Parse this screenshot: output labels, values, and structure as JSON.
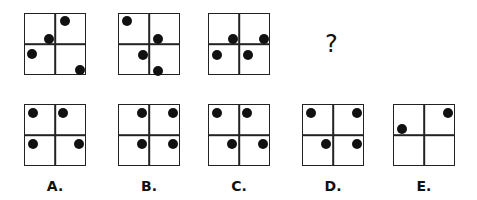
{
  "question": {
    "sequence": [
      {
        "id": "seq-1",
        "x": 24,
        "y": 13,
        "dots": [
          [
            40,
            7
          ],
          [
            24,
            25
          ],
          [
            7,
            40
          ],
          [
            55,
            56
          ]
        ]
      },
      {
        "id": "seq-2",
        "x": 118,
        "y": 13,
        "dots": [
          [
            8,
            7
          ],
          [
            39,
            25
          ],
          [
            24,
            41
          ],
          [
            39,
            57
          ]
        ]
      },
      {
        "id": "seq-3",
        "x": 208,
        "y": 13,
        "dots": [
          [
            24,
            25
          ],
          [
            55,
            25
          ],
          [
            8,
            41
          ],
          [
            39,
            41
          ]
        ]
      }
    ],
    "missing_symbol": "?"
  },
  "options": [
    {
      "label": "A.",
      "x": 24,
      "y": 104,
      "dots": [
        [
          8,
          8
        ],
        [
          38,
          8
        ],
        [
          8,
          39
        ],
        [
          54,
          39
        ]
      ]
    },
    {
      "label": "B.",
      "x": 118,
      "y": 104,
      "dots": [
        [
          23,
          8
        ],
        [
          54,
          8
        ],
        [
          23,
          39
        ],
        [
          54,
          39
        ]
      ]
    },
    {
      "label": "C.",
      "x": 208,
      "y": 104,
      "dots": [
        [
          8,
          8
        ],
        [
          38,
          8
        ],
        [
          23,
          39
        ],
        [
          54,
          39
        ]
      ]
    },
    {
      "label": "D.",
      "x": 302,
      "y": 104,
      "dots": [
        [
          8,
          8
        ],
        [
          54,
          8
        ],
        [
          23,
          39
        ],
        [
          54,
          39
        ]
      ]
    },
    {
      "label": "E.",
      "x": 393,
      "y": 104,
      "dots": [
        [
          8,
          24
        ],
        [
          54,
          8
        ]
      ]
    }
  ],
  "colors": {
    "line": "#222222",
    "dot": "#111111",
    "background": "#ffffff"
  }
}
